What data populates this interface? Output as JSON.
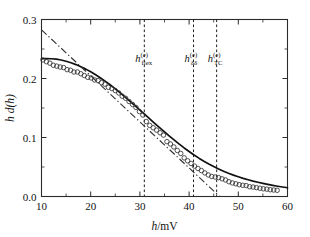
{
  "figure": {
    "background_color": "#ffffff",
    "width": 310,
    "height": 237
  },
  "chart_data": {
    "type": "line",
    "title": "",
    "subtitle": "",
    "xlabel": "h/mV",
    "ylabel": "h d(h)",
    "xlabel_parts": {
      "symbol": "h",
      "unit": "/mV"
    },
    "ylabel_parts": {
      "symbol1": "h",
      "symbol2": "d",
      "arg": "(h)"
    },
    "xlim": [
      10,
      60
    ],
    "ylim": [
      0.0,
      0.3
    ],
    "xticks": [
      10,
      20,
      30,
      40,
      50,
      60
    ],
    "xticklabels": [
      "10",
      "20",
      "30",
      "40",
      "50",
      "60"
    ],
    "xminorticks": [
      15,
      25,
      35,
      45,
      55
    ],
    "yticks": [
      0.0,
      0.1,
      0.2,
      0.3
    ],
    "yticklabels": [
      "0.0",
      "0.1",
      "0.2",
      "0.3"
    ],
    "yminorticks": [
      0.05,
      0.15,
      0.25
    ],
    "grid": false,
    "legend": "none",
    "frame": "box",
    "series": [
      {
        "name": "model-solid",
        "style": "solid",
        "color": "#111111",
        "x": [
          10,
          11,
          12,
          13,
          14,
          15,
          16,
          17,
          18,
          19,
          20,
          21,
          22,
          23,
          24,
          25,
          26,
          27,
          28,
          29,
          30,
          31,
          32,
          33,
          34,
          35,
          36,
          37,
          38,
          39,
          40,
          41,
          42,
          43,
          44,
          45,
          46,
          47,
          48,
          49,
          50,
          51,
          52,
          53,
          54,
          55,
          56,
          57,
          58,
          59,
          60
        ],
        "y": [
          0.2335,
          0.2338,
          0.2335,
          0.2327,
          0.2313,
          0.2293,
          0.2267,
          0.2236,
          0.22,
          0.2159,
          0.2113,
          0.2063,
          0.2009,
          0.1951,
          0.1889,
          0.1824,
          0.1756,
          0.1686,
          0.1614,
          0.1541,
          0.1466,
          0.1391,
          0.1316,
          0.1241,
          0.1167,
          0.1094,
          0.1023,
          0.0954,
          0.0887,
          0.0823,
          0.0762,
          0.0704,
          0.065,
          0.0599,
          0.0551,
          0.0507,
          0.0466,
          0.0429,
          0.0394,
          0.0363,
          0.0334,
          0.0307,
          0.0283,
          0.0261,
          0.0241,
          0.0222,
          0.0205,
          0.0189,
          0.0174,
          0.0161,
          0.0148
        ]
      },
      {
        "name": "asymptote-dashdot",
        "style": "dashdot",
        "color": "#333333",
        "x": [
          10,
          46.2
        ],
        "y": [
          0.2825,
          0.0
        ]
      },
      {
        "name": "experimental-data",
        "style": "circles",
        "marker": "open-circle",
        "color": "#333333",
        "x": [
          10.3,
          11.0,
          11.7,
          12.4,
          13.1,
          13.8,
          14.5,
          15.2,
          15.9,
          16.6,
          17.3,
          18.0,
          18.7,
          19.4,
          20.1,
          20.8,
          21.5,
          22.2,
          22.9,
          23.6,
          24.3,
          25.0,
          25.7,
          26.4,
          27.1,
          27.8,
          28.5,
          29.2,
          29.9,
          30.6,
          31.3,
          32.0,
          32.7,
          33.4,
          34.1,
          34.8,
          35.5,
          36.2,
          36.9,
          37.6,
          38.3,
          39.0,
          39.7,
          40.4,
          41.1,
          41.8,
          42.5,
          43.2,
          43.9,
          44.6,
          45.3,
          46.0,
          46.7,
          47.4,
          48.1,
          48.8,
          49.5,
          50.2,
          50.9,
          51.6,
          52.3,
          53.0,
          53.7,
          54.4,
          55.1,
          55.8,
          56.5,
          57.2,
          57.9
        ],
        "y": [
          0.2315,
          0.2285,
          0.226,
          0.2225,
          0.221,
          0.2195,
          0.2185,
          0.215,
          0.214,
          0.211,
          0.211,
          0.208,
          0.205,
          0.202,
          0.201,
          0.1975,
          0.1965,
          0.193,
          0.1905,
          0.185,
          0.183,
          0.1795,
          0.1755,
          0.17,
          0.1665,
          0.161,
          0.156,
          0.151,
          0.144,
          0.138,
          0.127,
          0.1205,
          0.1165,
          0.1125,
          0.108,
          0.104,
          0.093,
          0.089,
          0.084,
          0.078,
          0.073,
          0.0655,
          0.0605,
          0.056,
          0.0515,
          0.0475,
          0.044,
          0.04,
          0.0365,
          0.034,
          0.033,
          0.032,
          0.03,
          0.028,
          0.025,
          0.023,
          0.0215,
          0.02,
          0.019,
          0.0185,
          0.0165,
          0.016,
          0.015,
          0.014,
          0.013,
          0.0125,
          0.0115,
          0.011,
          0.0105
        ]
      }
    ],
    "vertical_markers": [
      {
        "id": "h-flex",
        "x": 30.9,
        "label_base": "h",
        "label_sub": "flex",
        "label_sup": "(e)",
        "style": "dashed"
      },
      {
        "id": "h-dd",
        "x": 40.9,
        "label_base": "h",
        "label_sub": "δδ",
        "label_sup": "(e)",
        "style": "dashed"
      },
      {
        "id": "h-tc",
        "x": 45.6,
        "label_base": "h",
        "label_sub": "TC",
        "label_sup": "(e)",
        "style": "dashed"
      }
    ]
  }
}
